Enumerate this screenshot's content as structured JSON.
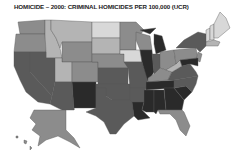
{
  "title": "HOMICIDE – 2000: CRIMINAL HOMICIDES PER 100,000 (UCR)",
  "map": {
    "type": "choropleth",
    "region": "United States",
    "metric": "Criminal homicides per 100,000",
    "year": "2000",
    "source": "UCR",
    "shade_scale": {
      "lightest": "#d8d8d8",
      "light": "#b4b4b4",
      "medium": "#8c8c8c",
      "dark": "#5a5a5a",
      "darkest": "#2a2a2a"
    },
    "states": [
      {
        "id": "WA",
        "shade": "medium"
      },
      {
        "id": "OR",
        "shade": "medium"
      },
      {
        "id": "CA",
        "shade": "dark"
      },
      {
        "id": "ID",
        "shade": "light"
      },
      {
        "id": "NV",
        "shade": "dark"
      },
      {
        "id": "MT",
        "shade": "light"
      },
      {
        "id": "WY",
        "shade": "medium"
      },
      {
        "id": "UT",
        "shade": "light"
      },
      {
        "id": "AZ",
        "shade": "dark"
      },
      {
        "id": "CO",
        "shade": "medium"
      },
      {
        "id": "NM",
        "shade": "darkest"
      },
      {
        "id": "ND",
        "shade": "lightest"
      },
      {
        "id": "SD",
        "shade": "light"
      },
      {
        "id": "NE",
        "shade": "medium"
      },
      {
        "id": "KS",
        "shade": "dark"
      },
      {
        "id": "OK",
        "shade": "dark"
      },
      {
        "id": "TX",
        "shade": "dark"
      },
      {
        "id": "MN",
        "shade": "medium"
      },
      {
        "id": "IA",
        "shade": "lightest"
      },
      {
        "id": "MO",
        "shade": "dark"
      },
      {
        "id": "AR",
        "shade": "dark"
      },
      {
        "id": "LA",
        "shade": "darkest"
      },
      {
        "id": "WI",
        "shade": "medium"
      },
      {
        "id": "IL",
        "shade": "darkest"
      },
      {
        "id": "MI",
        "shade": "darkest"
      },
      {
        "id": "IN",
        "shade": "dark"
      },
      {
        "id": "OH",
        "shade": "medium"
      },
      {
        "id": "KY",
        "shade": "medium"
      },
      {
        "id": "TN",
        "shade": "darkest"
      },
      {
        "id": "MS",
        "shade": "darkest"
      },
      {
        "id": "AL",
        "shade": "darkest"
      },
      {
        "id": "GA",
        "shade": "darkest"
      },
      {
        "id": "FL",
        "shade": "medium"
      },
      {
        "id": "SC",
        "shade": "darkest"
      },
      {
        "id": "NC",
        "shade": "dark"
      },
      {
        "id": "VA",
        "shade": "dark"
      },
      {
        "id": "WV",
        "shade": "light"
      },
      {
        "id": "PA",
        "shade": "medium"
      },
      {
        "id": "NY",
        "shade": "dark"
      },
      {
        "id": "ME",
        "shade": "lightest"
      },
      {
        "id": "NH",
        "shade": "lightest"
      },
      {
        "id": "VT",
        "shade": "lightest"
      },
      {
        "id": "MA",
        "shade": "light"
      },
      {
        "id": "MD",
        "shade": "darkest"
      },
      {
        "id": "NJ",
        "shade": "medium"
      },
      {
        "id": "AK",
        "shade": "medium"
      },
      {
        "id": "HI",
        "shade": "medium"
      }
    ]
  }
}
